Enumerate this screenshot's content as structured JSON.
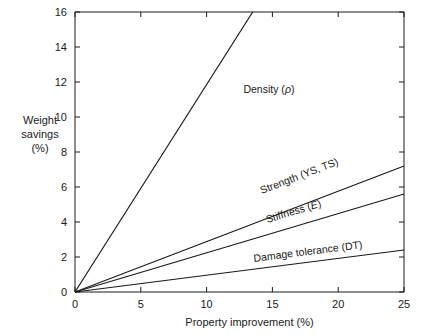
{
  "chart_data": {
    "type": "line",
    "title": "",
    "xlabel": "Property improvement (%)",
    "ylabel": "Weight savings (%)",
    "ylabel_lines": [
      "Weight",
      "savings",
      "(%)"
    ],
    "xlim": [
      0,
      25
    ],
    "ylim": [
      0,
      16
    ],
    "xticks": [
      0,
      5,
      10,
      15,
      20,
      25
    ],
    "yticks": [
      0,
      2,
      4,
      6,
      8,
      10,
      12,
      14,
      16
    ],
    "xtick_labels": [
      "0",
      "5",
      "10",
      "15",
      "20",
      "25"
    ],
    "ytick_labels": [
      "0",
      "2",
      "4",
      "6",
      "8",
      "10",
      "12",
      "14",
      "16"
    ],
    "grid": false,
    "legend_position": "inline-annotations",
    "x": [
      0,
      25
    ],
    "series": [
      {
        "name": "Density",
        "label": "Density (ρ)",
        "label_prefix": "Density (",
        "label_symbol": "ρ",
        "label_suffix": ")",
        "values": [
          0,
          29.6
        ],
        "clipped_at_top": true,
        "clip_x": 13.5,
        "clip_y": 16,
        "label_x": 12.8,
        "label_y": 11.4,
        "color": "#1a1a1a"
      },
      {
        "name": "Strength",
        "label": "Strength (YS, TS)",
        "label_prefix": "Strength (YS, TS)",
        "label_symbol": "",
        "label_suffix": "",
        "values": [
          0,
          7.2
        ],
        "clipped_at_top": false,
        "label_x": 14.2,
        "label_y": 5.6,
        "color": "#1a1a1a"
      },
      {
        "name": "Stiffness",
        "label": "Stiffness (E)",
        "label_prefix": "Stiffness (",
        "label_symbol": "E",
        "label_suffix": ")",
        "values": [
          0,
          5.6
        ],
        "clipped_at_top": false,
        "label_x": 14.6,
        "label_y": 3.95,
        "color": "#1a1a1a"
      },
      {
        "name": "Damage tolerance",
        "label": "Damage tolerance (DT)",
        "label_prefix": "Damage tolerance (DT)",
        "label_symbol": "",
        "label_suffix": "",
        "values": [
          0,
          2.4
        ],
        "clipped_at_top": false,
        "label_x": 13.6,
        "label_y": 1.72,
        "color": "#1a1a1a"
      }
    ],
    "axis_color": "#1a1a1a",
    "background": "#ffffff"
  }
}
